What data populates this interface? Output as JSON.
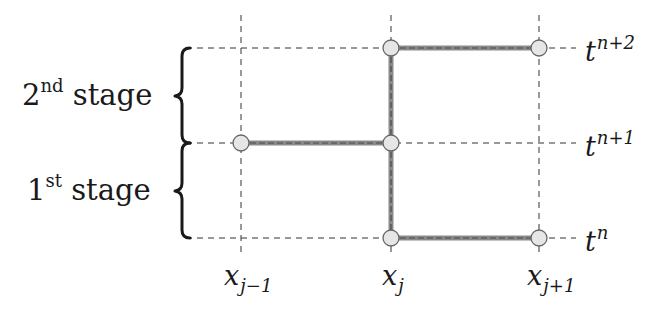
{
  "diagram": {
    "stages": [
      {
        "id": "stage-2",
        "number": "2",
        "ordinal_suffix": "nd",
        "word": "stage"
      },
      {
        "id": "stage-1",
        "number": "1",
        "ordinal_suffix": "st",
        "word": "stage"
      }
    ],
    "x_labels": [
      {
        "base": "x",
        "subscript": "j−1"
      },
      {
        "base": "x",
        "subscript": "j"
      },
      {
        "base": "x",
        "subscript": "j+1"
      }
    ],
    "t_labels": [
      {
        "base": "t",
        "superscript": "n+2"
      },
      {
        "base": "t",
        "superscript": "n+1"
      },
      {
        "base": "t",
        "superscript": "n"
      }
    ],
    "grid": {
      "x_positions": [
        241,
        391,
        539
      ],
      "y_positions": [
        48,
        143,
        238
      ]
    },
    "nodes": [
      {
        "x": 391,
        "y": 48
      },
      {
        "x": 539,
        "y": 48
      },
      {
        "x": 241,
        "y": 143
      },
      {
        "x": 391,
        "y": 143
      },
      {
        "x": 391,
        "y": 238
      },
      {
        "x": 539,
        "y": 238
      }
    ],
    "edges": [
      {
        "from": [
          391,
          48
        ],
        "to": [
          539,
          48
        ]
      },
      {
        "from": [
          391,
          48
        ],
        "to": [
          391,
          143
        ]
      },
      {
        "from": [
          241,
          143
        ],
        "to": [
          391,
          143
        ]
      },
      {
        "from": [
          391,
          143
        ],
        "to": [
          391,
          238
        ]
      },
      {
        "from": [
          391,
          238
        ],
        "to": [
          539,
          238
        ]
      }
    ],
    "colors": {
      "grid_line": "#333333",
      "edge_outer": "#7a7a7a",
      "edge_inner": "#555555",
      "node_fill": "#e6e6e6",
      "node_stroke": "#666666",
      "brace": "#1a1a1a",
      "text": "#1a1a1a"
    }
  }
}
